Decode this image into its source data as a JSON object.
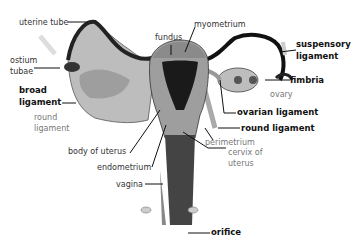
{
  "diagram": {
    "labels": [
      {
        "id": "uterine_tube",
        "text": "uterine tube",
        "weight": "normal"
      },
      {
        "id": "fundus",
        "text": "fundus",
        "weight": "normal"
      },
      {
        "id": "myometrium",
        "text": "myometrium",
        "weight": "normal"
      },
      {
        "id": "suspensory_ligament_1",
        "text": "suspensory",
        "weight": "bold"
      },
      {
        "id": "suspensory_ligament_2",
        "text": "ligament",
        "weight": "bold"
      },
      {
        "id": "ostium_tubae_1",
        "text": "ostium",
        "weight": "normal"
      },
      {
        "id": "ostium_tubae_2",
        "text": "tubae",
        "weight": "normal"
      },
      {
        "id": "fimbria",
        "text": "fimbria",
        "weight": "bold"
      },
      {
        "id": "ovary",
        "text": "ovary",
        "weight": "light"
      },
      {
        "id": "broad_ligament_1",
        "text": "broad",
        "weight": "bold"
      },
      {
        "id": "broad_ligament_2",
        "text": "ligament",
        "weight": "bold"
      },
      {
        "id": "ovarian_ligament",
        "text": "ovarian ligament",
        "weight": "bold"
      },
      {
        "id": "round_ligament_left_1",
        "text": "round",
        "weight": "normal"
      },
      {
        "id": "round_ligament_left_2",
        "text": "ligament",
        "weight": "normal"
      },
      {
        "id": "round_ligament_right",
        "text": "round ligament",
        "weight": "bold"
      },
      {
        "id": "body_of_uterus",
        "text": "body of uterus",
        "weight": "normal"
      },
      {
        "id": "perimetrium",
        "text": "perimetrium",
        "weight": "light"
      },
      {
        "id": "cervix_1",
        "text": "cervix of",
        "weight": "light"
      },
      {
        "id": "cervix_2",
        "text": "uterus",
        "weight": "light"
      },
      {
        "id": "endometrium",
        "text": "endometrium",
        "weight": "normal"
      },
      {
        "id": "vagina",
        "text": "vagina",
        "weight": "normal"
      },
      {
        "id": "orifice",
        "text": "orifice",
        "weight": "bold"
      }
    ]
  }
}
